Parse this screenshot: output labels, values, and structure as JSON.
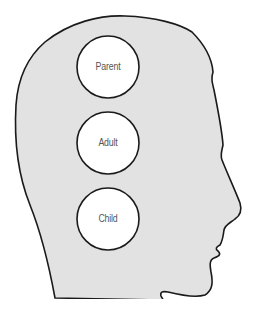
{
  "diagram": {
    "colors": {
      "head_fill": "#e2e2e2",
      "outline": "#1a1a1a",
      "circle_fill": "#ffffff",
      "label": "#555555"
    },
    "ego_states": [
      {
        "label": "Parent",
        "cx": 108,
        "cy": 67,
        "r": 31
      },
      {
        "label": "Adult",
        "cx": 108,
        "cy": 143,
        "r": 31
      },
      {
        "label": "Child",
        "cx": 108,
        "cy": 219,
        "r": 31
      }
    ]
  }
}
